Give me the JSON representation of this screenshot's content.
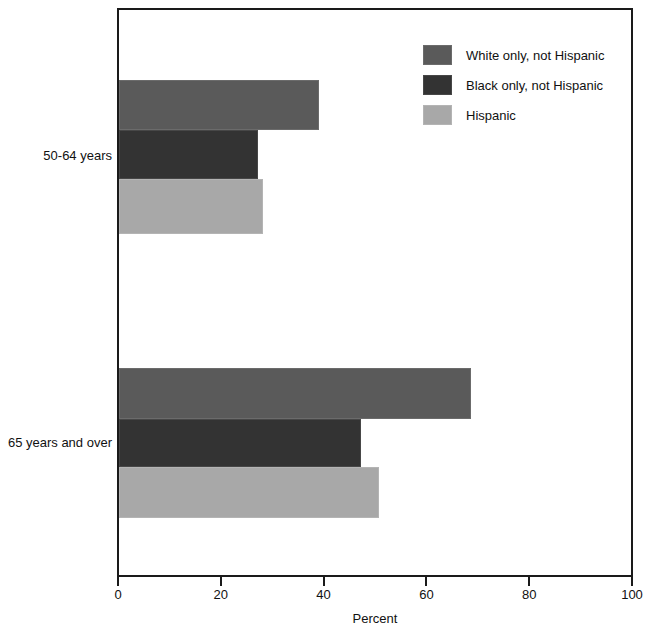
{
  "chart_data": {
    "type": "bar",
    "orientation": "horizontal",
    "title": "",
    "subtitle": "",
    "xlabel": "Percent",
    "ylabel": "",
    "xlim": [
      0,
      100
    ],
    "xticks": [
      0,
      20,
      40,
      60,
      80,
      100
    ],
    "xticklabels": [
      "0",
      "20",
      "40",
      "60",
      "80",
      "100"
    ],
    "grid": false,
    "legend_position": "top-right",
    "categories": [
      "50-64 years",
      "65 years and over"
    ],
    "series": [
      {
        "name": "White only, not Hispanic",
        "color": "#5a5a5a",
        "values": [
          39,
          68.4
        ]
      },
      {
        "name": "Black only, not Hispanic",
        "color": "#333333",
        "values": [
          27,
          47
        ]
      },
      {
        "name": "Hispanic",
        "color": "#a8a8a8",
        "values": [
          28,
          50.5
        ]
      }
    ]
  },
  "axis": {
    "x_title": "Percent",
    "ticks": [
      {
        "value": 0,
        "label": "0"
      },
      {
        "value": 20,
        "label": "20"
      },
      {
        "value": 40,
        "label": "40"
      },
      {
        "value": 60,
        "label": "60"
      },
      {
        "value": 80,
        "label": "80"
      },
      {
        "value": 100,
        "label": "100"
      }
    ]
  },
  "groups": [
    {
      "label": "50-64 years"
    },
    {
      "label": "65 years and over"
    }
  ],
  "legend": {
    "entries": [
      {
        "label": "White only, not Hispanic",
        "color": "#5a5a5a"
      },
      {
        "label": "Black only, not Hispanic",
        "color": "#333333"
      },
      {
        "label": "Hispanic",
        "color": "#a8a8a8"
      }
    ]
  }
}
